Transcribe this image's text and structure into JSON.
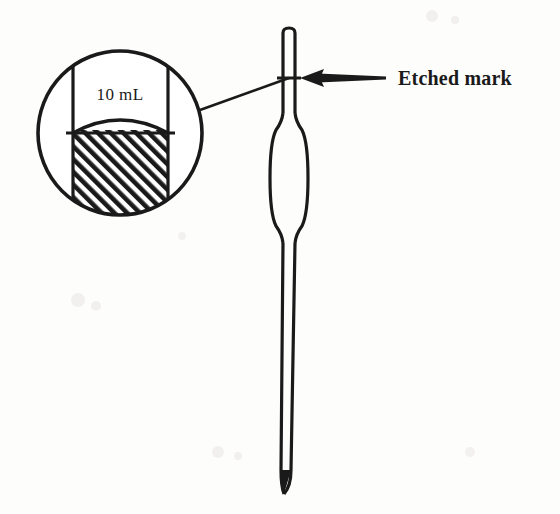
{
  "figure": {
    "kind": "volumetric-pipet-diagram",
    "background_color": "#fdfdfc",
    "ink_color": "#1a1a1a"
  },
  "callout_label": {
    "text": "Etched mark",
    "x": 398,
    "y": 78
  },
  "inset": {
    "volume_label": "10 mL",
    "circle": {
      "center_x": 120,
      "center_y": 133,
      "radius": 83
    },
    "tube_left_x": 73,
    "tube_right_x": 168,
    "liquid_line_y": 133,
    "meniscus_depth": 26,
    "hatch_angle_deg": 45
  },
  "pipet": {
    "top_y": 28,
    "tip_y": 494,
    "stem_left_x": 283,
    "stem_right_x": 295,
    "mark_y": 78,
    "bulb_top_y": 113,
    "bulb_bottom_y": 243,
    "bulb_left_x": 270,
    "bulb_right_x": 308
  },
  "arrow": {
    "tail_x": 386,
    "head_x": 300,
    "y": 78
  },
  "leader_line": {
    "from_x": 200,
    "from_y": 110,
    "to_x": 289,
    "to_y": 78
  }
}
